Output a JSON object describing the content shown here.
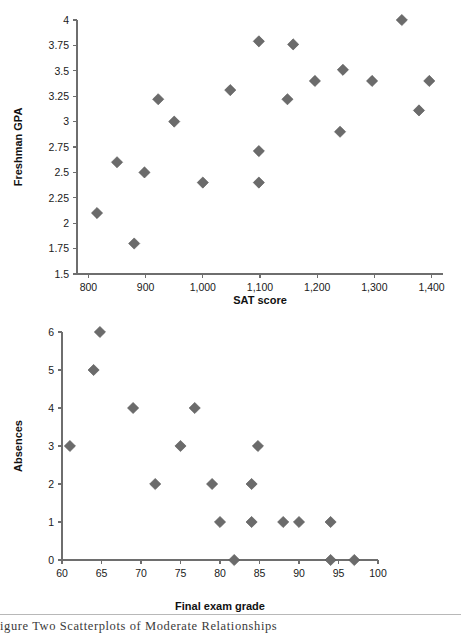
{
  "figure": {
    "caption": "igure   Two Scatterplots of Moderate Relationships",
    "marker_color": "#6b6b6b",
    "axis_color": "#6e6e6e",
    "background": "#ffffff"
  },
  "chart_data": [
    {
      "type": "scatter",
      "id": "gpa-vs-sat",
      "title": "",
      "xlabel": "SAT score",
      "ylabel": "Freshman GPA",
      "xlim": [
        780,
        1420
      ],
      "ylim": [
        1.5,
        4
      ],
      "xticks": [
        800,
        900,
        1000,
        1100,
        1200,
        1300,
        1400
      ],
      "xticklabels": [
        "800",
        "900",
        "1,000",
        "1,100",
        "1,200",
        "1,300",
        "1,400"
      ],
      "yticks": [
        1.5,
        1.75,
        2,
        2.25,
        2.5,
        2.75,
        3,
        3.25,
        3.5,
        3.75,
        4
      ],
      "yticklabels": [
        "1.5",
        "1.75",
        "2",
        "2.25",
        "2.5",
        "2.75",
        "3",
        "3.25",
        "3.5",
        "3.75",
        "4"
      ],
      "grid": false,
      "legend": null,
      "points": [
        {
          "x": 815,
          "y": 2.1
        },
        {
          "x": 850,
          "y": 2.6
        },
        {
          "x": 880,
          "y": 1.8
        },
        {
          "x": 898,
          "y": 2.5
        },
        {
          "x": 922,
          "y": 3.22
        },
        {
          "x": 950,
          "y": 3.0
        },
        {
          "x": 1000,
          "y": 2.4
        },
        {
          "x": 1048,
          "y": 3.31
        },
        {
          "x": 1098,
          "y": 2.4
        },
        {
          "x": 1098,
          "y": 2.71
        },
        {
          "x": 1098,
          "y": 3.79
        },
        {
          "x": 1148,
          "y": 3.22
        },
        {
          "x": 1158,
          "y": 3.76
        },
        {
          "x": 1196,
          "y": 3.4
        },
        {
          "x": 1240,
          "y": 2.9
        },
        {
          "x": 1245,
          "y": 3.51
        },
        {
          "x": 1296,
          "y": 3.4
        },
        {
          "x": 1348,
          "y": 4.0
        },
        {
          "x": 1378,
          "y": 3.11
        },
        {
          "x": 1396,
          "y": 3.4
        }
      ]
    },
    {
      "type": "scatter",
      "id": "absences-vs-final-exam",
      "title": "",
      "xlabel": "Final exam grade",
      "ylabel": "Absences",
      "xlim": [
        60,
        100
      ],
      "ylim": [
        0,
        6
      ],
      "xticks": [
        60,
        65,
        70,
        75,
        80,
        85,
        90,
        95,
        100
      ],
      "xticklabels": [
        "60",
        "65",
        "70",
        "75",
        "80",
        "85",
        "90",
        "95",
        "100"
      ],
      "yticks": [
        0,
        1,
        2,
        3,
        4,
        5,
        6
      ],
      "yticklabels": [
        "0",
        "1",
        "2",
        "3",
        "4",
        "5",
        "6"
      ],
      "grid": false,
      "legend": null,
      "points": [
        {
          "x": 61,
          "y": 3
        },
        {
          "x": 64,
          "y": 5
        },
        {
          "x": 64.8,
          "y": 6
        },
        {
          "x": 69,
          "y": 4
        },
        {
          "x": 71.8,
          "y": 2
        },
        {
          "x": 75,
          "y": 3
        },
        {
          "x": 76.8,
          "y": 4
        },
        {
          "x": 79,
          "y": 2
        },
        {
          "x": 80,
          "y": 1
        },
        {
          "x": 81.8,
          "y": 0
        },
        {
          "x": 84,
          "y": 2
        },
        {
          "x": 84,
          "y": 1
        },
        {
          "x": 84.8,
          "y": 3
        },
        {
          "x": 88,
          "y": 1
        },
        {
          "x": 90,
          "y": 1
        },
        {
          "x": 94,
          "y": 1
        },
        {
          "x": 94,
          "y": 0
        },
        {
          "x": 97,
          "y": 0
        }
      ]
    }
  ]
}
